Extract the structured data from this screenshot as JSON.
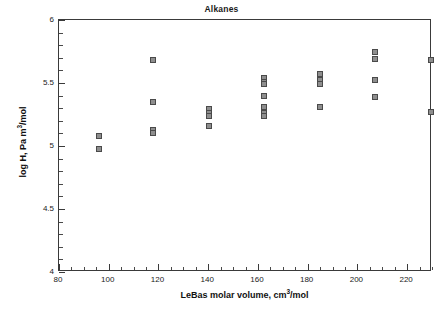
{
  "chart_data": {
    "type": "scatter",
    "title": "Alkanes",
    "xlabel": "LeBas molar volume, cm3/mol",
    "ylabel": "log H, Pa m3/mol",
    "xlim": [
      80,
      230
    ],
    "ylim": [
      4,
      6
    ],
    "grid": false,
    "legend": null,
    "x_major_ticks": [
      80,
      100,
      120,
      140,
      160,
      180,
      200,
      220
    ],
    "x_minor_interval": 5,
    "y_major_ticks": [
      4,
      4.5,
      5,
      5.5,
      6
    ],
    "y_minor_interval": 0.1,
    "x_tick_labels": [
      "80",
      "100",
      "120",
      "140",
      "160",
      "180",
      "200",
      "220"
    ],
    "y_tick_labels": [
      "4",
      "4.5",
      "5",
      "5.5",
      "6"
    ],
    "marker": "square",
    "marker_fill": "#8e8e8e",
    "marker_edge": "#4a4a4a",
    "points": [
      {
        "x": 96.0,
        "y": 5.08
      },
      {
        "x": 96.0,
        "y": 4.98
      },
      {
        "x": 118.0,
        "y": 5.68
      },
      {
        "x": 118.0,
        "y": 5.35
      },
      {
        "x": 118.0,
        "y": 5.13
      },
      {
        "x": 118.0,
        "y": 5.1
      },
      {
        "x": 140.5,
        "y": 5.29
      },
      {
        "x": 140.5,
        "y": 5.26
      },
      {
        "x": 140.5,
        "y": 5.24
      },
      {
        "x": 140.5,
        "y": 5.16
      },
      {
        "x": 162.5,
        "y": 5.54
      },
      {
        "x": 162.5,
        "y": 5.51
      },
      {
        "x": 162.5,
        "y": 5.49
      },
      {
        "x": 162.5,
        "y": 5.4
      },
      {
        "x": 162.5,
        "y": 5.31
      },
      {
        "x": 162.5,
        "y": 5.26
      },
      {
        "x": 162.5,
        "y": 5.24
      },
      {
        "x": 185.0,
        "y": 5.57
      },
      {
        "x": 185.0,
        "y": 5.52
      },
      {
        "x": 185.0,
        "y": 5.49
      },
      {
        "x": 185.0,
        "y": 5.31
      },
      {
        "x": 207.0,
        "y": 5.75
      },
      {
        "x": 207.0,
        "y": 5.69
      },
      {
        "x": 207.0,
        "y": 5.52
      },
      {
        "x": 207.0,
        "y": 5.39
      },
      {
        "x": 229.5,
        "y": 5.68
      },
      {
        "x": 229.5,
        "y": 5.27
      }
    ]
  },
  "figure": {
    "title": "Alkanes",
    "x_axis_title_main": "LeBas molar volume, cm",
    "x_axis_title_sup": "3",
    "x_axis_title_tail": "/mol",
    "y_axis_title_main": "log H, Pa m",
    "y_axis_title_sup": "3",
    "y_axis_title_tail": "/mol",
    "caption_fragment": ""
  }
}
